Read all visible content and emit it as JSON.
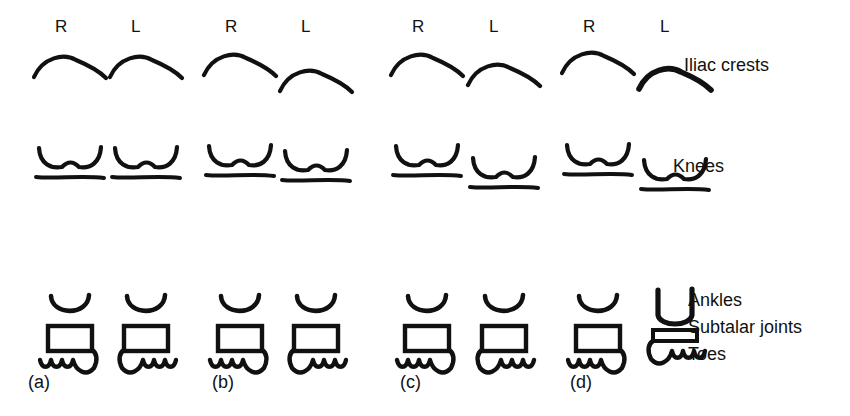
{
  "figure": {
    "background_color": "#ffffff",
    "ink_color": "#111111",
    "width": 850,
    "height": 416
  },
  "row_labels": [
    {
      "id": "iliac-crests",
      "text": "Iliac crests",
      "x": 684,
      "y": 71
    },
    {
      "id": "knees",
      "text": "Knees",
      "x": 673,
      "y": 172
    },
    {
      "id": "ankles",
      "text": "Ankles",
      "x": 688,
      "y": 306
    },
    {
      "id": "subtalar",
      "text": "Subtalar joints",
      "x": 688,
      "y": 333
    },
    {
      "id": "toes",
      "text": "Toes",
      "x": 688,
      "y": 360
    }
  ],
  "panels": [
    {
      "id": "a",
      "label": "(a)",
      "label_x": 28,
      "label_y": 388,
      "sides": [
        {
          "id": "a-R",
          "letter": "R",
          "letter_x": 55,
          "letter_y": 32,
          "crest_y": 66,
          "crest_style": "normal",
          "knee_y": 160,
          "ankle_y": 310,
          "ankle_style": "normal",
          "subtalar_style": "box",
          "toes_dir": "left"
        },
        {
          "id": "a-L",
          "letter": "L",
          "letter_x": 131,
          "letter_y": 32,
          "crest_y": 66,
          "crest_style": "normal",
          "knee_y": 160,
          "ankle_y": 310,
          "ankle_style": "normal",
          "subtalar_style": "box",
          "toes_dir": "right"
        }
      ]
    },
    {
      "id": "b",
      "label": "(b)",
      "label_x": 212,
      "label_y": 388,
      "sides": [
        {
          "id": "b-R",
          "letter": "R",
          "letter_x": 225,
          "letter_y": 32,
          "crest_y": 64,
          "crest_style": "normal",
          "knee_y": 158,
          "ankle_y": 310,
          "ankle_style": "normal",
          "subtalar_style": "box",
          "toes_dir": "left"
        },
        {
          "id": "b-L",
          "letter": "L",
          "letter_x": 301,
          "letter_y": 32,
          "crest_y": 80,
          "crest_style": "normal",
          "knee_y": 163,
          "ankle_y": 310,
          "ankle_style": "normal",
          "subtalar_style": "box",
          "toes_dir": "right"
        }
      ]
    },
    {
      "id": "c",
      "label": "(c)",
      "label_x": 400,
      "label_y": 388,
      "sides": [
        {
          "id": "c-R",
          "letter": "R",
          "letter_x": 412,
          "letter_y": 32,
          "crest_y": 64,
          "crest_style": "normal",
          "knee_y": 158,
          "ankle_y": 310,
          "ankle_style": "normal",
          "subtalar_style": "box",
          "toes_dir": "left"
        },
        {
          "id": "c-L",
          "letter": "L",
          "letter_x": 489,
          "letter_y": 32,
          "crest_y": 74,
          "crest_style": "normal",
          "knee_y": 170,
          "ankle_y": 310,
          "ankle_style": "normal",
          "subtalar_style": "box",
          "toes_dir": "right"
        }
      ]
    },
    {
      "id": "d",
      "label": "(d)",
      "label_x": 570,
      "label_y": 388,
      "sides": [
        {
          "id": "d-R",
          "letter": "R",
          "letter_x": 583,
          "letter_y": 32,
          "crest_y": 62,
          "crest_style": "normal",
          "knee_y": 157,
          "ankle_y": 310,
          "ankle_style": "normal",
          "subtalar_style": "box",
          "toes_dir": "left"
        },
        {
          "id": "d-L",
          "letter": "L",
          "letter_x": 660,
          "letter_y": 32,
          "crest_y": 78,
          "crest_style": "thick",
          "knee_y": 172,
          "ankle_y": 306,
          "ankle_style": "deep",
          "subtalar_style": "flat",
          "toes_dir": "right"
        }
      ]
    }
  ],
  "chart_data": {
    "type": "diagram",
    "levels": [
      "Iliac crests",
      "Knees",
      "Ankles",
      "Subtalar joints",
      "Toes"
    ],
    "sides": [
      "R",
      "L"
    ],
    "panels": [
      {
        "panel": "(a)",
        "description": "All levels symmetric and level",
        "iliac_crests": {
          "R": "level",
          "L": "level"
        },
        "knees": {
          "R": "level",
          "L": "level"
        },
        "ankles": {
          "R": "normal",
          "L": "normal"
        },
        "subtalar_joints": {
          "R": "normal box",
          "L": "normal box"
        },
        "toes": {
          "R": "normal",
          "L": "normal"
        }
      },
      {
        "panel": "(b)",
        "description": "Left iliac crest lower; knees near level",
        "iliac_crests": {
          "R": "level",
          "L": "lower"
        },
        "knees": {
          "R": "level",
          "L": "level"
        },
        "ankles": {
          "R": "normal",
          "L": "normal"
        },
        "subtalar_joints": {
          "R": "normal box",
          "L": "normal box"
        },
        "toes": {
          "R": "normal",
          "L": "normal"
        }
      },
      {
        "panel": "(c)",
        "description": "Left iliac crest lower and left knee lower",
        "iliac_crests": {
          "R": "level",
          "L": "lower"
        },
        "knees": {
          "R": "level",
          "L": "lower"
        },
        "ankles": {
          "R": "normal",
          "L": "normal"
        },
        "subtalar_joints": {
          "R": "normal box",
          "L": "normal box"
        },
        "toes": {
          "R": "normal",
          "L": "normal"
        }
      },
      {
        "panel": "(d)",
        "description": "Left crest lower, left knee lower, left ankle deep with flattened subtalar joint",
        "iliac_crests": {
          "R": "level",
          "L": "lower"
        },
        "knees": {
          "R": "level",
          "L": "lower"
        },
        "ankles": {
          "R": "normal",
          "L": "deep / elongated"
        },
        "subtalar_joints": {
          "R": "normal box",
          "L": "flattened"
        },
        "toes": {
          "R": "normal",
          "L": "normal"
        }
      }
    ]
  }
}
